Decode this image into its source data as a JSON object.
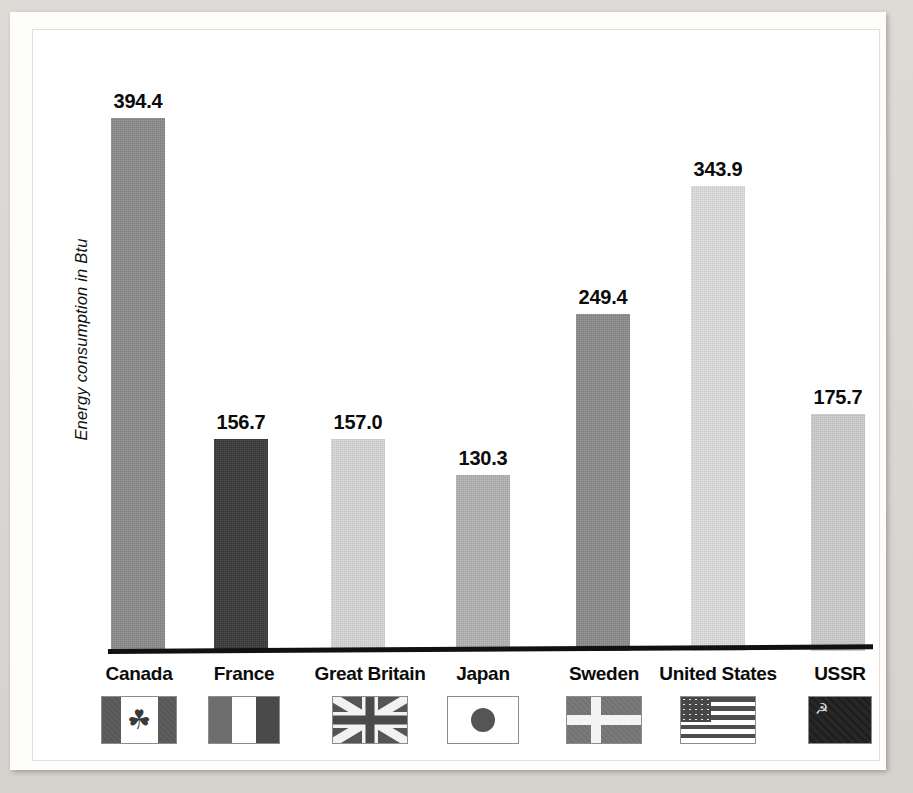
{
  "chart_data": {
    "type": "bar",
    "title": "",
    "xlabel": "",
    "ylabel": "Energy consumption in Btu",
    "ylim": [
      0,
      430
    ],
    "grid": false,
    "legend": "none",
    "categories": [
      "Canada",
      "France",
      "Great Britain",
      "Japan",
      "Sweden",
      "United States",
      "USSR"
    ],
    "values": [
      394.4,
      156.7,
      157.0,
      130.3,
      249.4,
      343.9,
      175.7
    ],
    "value_labels": [
      "394.4",
      "156.7",
      "157.0",
      "130.3",
      "249.4",
      "343.9",
      "175.7"
    ],
    "bar_colors": [
      "#8d8d8d",
      "#3a3a3a",
      "#d9d9d9",
      "#b5b5b5",
      "#8d8d8d",
      "#e0e0e0",
      "#cfcfcf"
    ],
    "icons": [
      "flag-canada-icon",
      "flag-france-icon",
      "flag-great-britain-icon",
      "flag-japan-icon",
      "flag-sweden-icon",
      "flag-united-states-icon",
      "flag-ussr-icon"
    ]
  },
  "axis": {
    "y_title": "Energy consumption in Btu"
  },
  "bars": [
    {
      "label": "Canada",
      "value": "394.4",
      "icon": "flag-canada-icon"
    },
    {
      "label": "France",
      "value": "156.7",
      "icon": "flag-france-icon"
    },
    {
      "label": "Great Britain",
      "value": "157.0",
      "icon": "flag-great-britain-icon"
    },
    {
      "label": "Japan",
      "value": "130.3",
      "icon": "flag-japan-icon"
    },
    {
      "label": "Sweden",
      "value": "249.4",
      "icon": "flag-sweden-icon"
    },
    {
      "label": "United States",
      "value": "343.9",
      "icon": "flag-united-states-icon"
    },
    {
      "label": "USSR",
      "value": "175.7",
      "icon": "flag-ussr-icon"
    }
  ],
  "palette": {
    "page_background": "#d6d3ce",
    "paper": "#fdfdfc",
    "axis": "#111111",
    "text": "#0b0b0b"
  },
  "glyphs": {
    "maple_leaf": "☘",
    "hammer_sickle": "☭"
  }
}
